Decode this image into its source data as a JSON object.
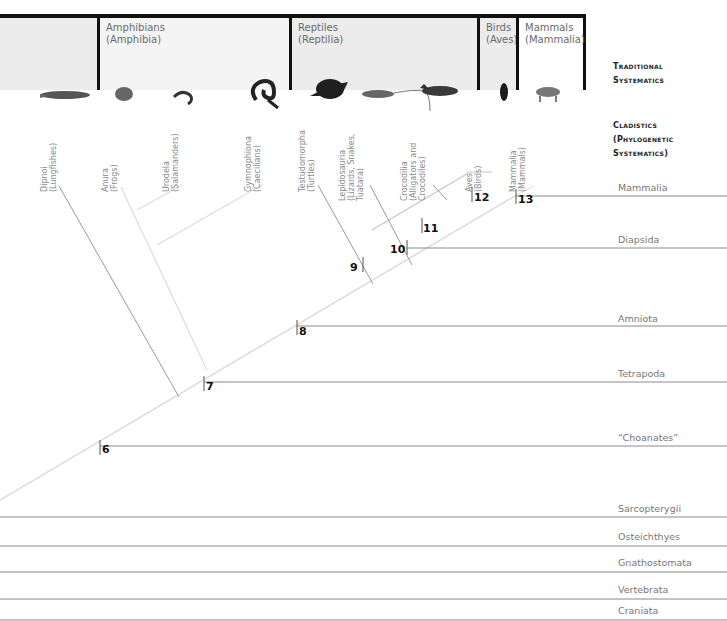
{
  "traditional_systematics": {
    "title_line1": "Traditional",
    "title_line2": "Systematics",
    "groups": [
      {
        "name": "",
        "latin": ""
      },
      {
        "name": "Amphibians",
        "latin": "(Amphibia)"
      },
      {
        "name": "Reptiles",
        "latin": "(Reptilia)"
      },
      {
        "name": "Birds",
        "latin": "(Aves)"
      },
      {
        "name": "Mammals",
        "latin": "(Mammalia)"
      }
    ]
  },
  "cladistics": {
    "title_line1": "Cladistics",
    "title_line2": "(Phylogenetic",
    "title_line3": "Systematics)"
  },
  "taxa": [
    {
      "name": "Dipnoi",
      "common": "(Lungfishes)",
      "icon": "lungfish-icon"
    },
    {
      "name": "Anura",
      "common": "(Frogs)",
      "icon": "frog-icon"
    },
    {
      "name": "Urodela",
      "common": "(Salamanders)",
      "icon": "salamander-icon"
    },
    {
      "name": "Gymnophiona",
      "common": "(Caecilians)",
      "icon": "caecilian-icon"
    },
    {
      "name": "Testudomorpha",
      "common": "(Turtles)",
      "icon": "turtle-icon"
    },
    {
      "name": "Lepidosauria",
      "common": "(Lizards, Snakes,\nTuatara)",
      "icon": "lizard-icon"
    },
    {
      "name": "Crocodilia",
      "common": "(Alligators and\nCrocodiles)",
      "icon": "crocodile-icon"
    },
    {
      "name": "Aves",
      "common": "(Birds)",
      "icon": "bird-icon"
    },
    {
      "name": "Mammalia",
      "common": "(Mammals)",
      "icon": "tiger-icon"
    }
  ],
  "clades": [
    {
      "label": "Mammalia",
      "node": "13"
    },
    {
      "label": "Diapsida",
      "node": "10"
    },
    {
      "label": "Amniota",
      "node": "8"
    },
    {
      "label": "Tetrapoda",
      "node": "7"
    },
    {
      "label": "“Choanates”",
      "node": "6"
    },
    {
      "label": "Sarcopterygii",
      "node": ""
    },
    {
      "label": "Osteichthyes",
      "node": ""
    },
    {
      "label": "Gnathostomata",
      "node": ""
    },
    {
      "label": "Vertebrata",
      "node": ""
    },
    {
      "label": "Craniata",
      "node": ""
    }
  ],
  "nodes": [
    "6",
    "7",
    "8",
    "9",
    "10",
    "11",
    "12",
    "13"
  ],
  "colors": {
    "header_shade": "#ececec",
    "border": "#111111",
    "line": "#8a8a8a",
    "light_line": "#d8d8d8"
  }
}
